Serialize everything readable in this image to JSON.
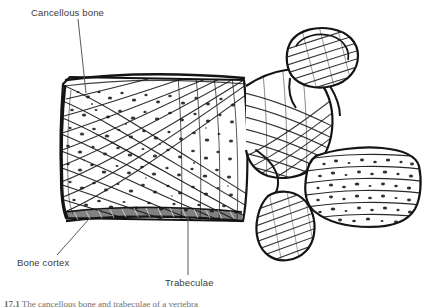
{
  "figure": {
    "type": "anatomical-line-drawing",
    "background_color": "#ffffff",
    "ink_color": "#1a1a1a",
    "label_color": "#3a3a3a",
    "caption_color": "#6e6e6e"
  },
  "labels": [
    {
      "id": "cancellous-bone",
      "text": "Cancellous bone",
      "x": 31,
      "y": 7,
      "leader": {
        "x1": 78,
        "y1": 19,
        "x2": 86,
        "y2": 93
      }
    },
    {
      "id": "bone-cortex",
      "text": "Bone cortex",
      "x": 17,
      "y": 257,
      "leader": {
        "x1": 57,
        "y1": 255,
        "x2": 89,
        "y2": 219
      }
    },
    {
      "id": "trabeculae",
      "text": "Trabeculae",
      "x": 165,
      "y": 277,
      "leader": {
        "x1": 188,
        "y1": 275,
        "x2": 188,
        "y2": 216
      }
    }
  ],
  "caption": {
    "number": "17.1",
    "text": "The cancellous bone and trabeculae of a vertebra",
    "clipped": true
  },
  "structures": [
    {
      "name": "vertebral-body",
      "description": "Large rectangular anterior body with concave anterior border, crosshatched trabecular network and stippled marrow spaces"
    },
    {
      "name": "superior-endplate",
      "description": "Thin curved cortical line along the top of the vertebral body"
    },
    {
      "name": "inferior-endplate",
      "description": "Dense dark hatched cortical band along the bottom of the vertebral body"
    },
    {
      "name": "anterior-cortex",
      "description": "Concave cortical margin on the left side of the body"
    },
    {
      "name": "pedicle",
      "description": "Short thick bridge connecting the body to the posterior elements"
    },
    {
      "name": "superior-articular-process",
      "description": "Rounded knob projecting upward and backward with diagonal hatching"
    },
    {
      "name": "inferior-articular-process",
      "description": "Rounded lobe projecting downward and backward with diagonal hatching"
    },
    {
      "name": "spinous-process",
      "description": "Broad posterior projection with horizontal trabecular bands and stippling"
    },
    {
      "name": "vertebral-foramen-notch",
      "description": "Concave notch between the articular processes"
    }
  ]
}
